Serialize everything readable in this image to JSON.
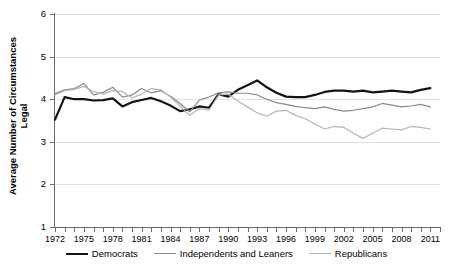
{
  "chart_data": {
    "type": "line",
    "title": "",
    "xlabel": "",
    "ylabel": "Average Number of Circumstances Legal",
    "ylabel_line1": "Average Number of Circumstances",
    "ylabel_line2": "Legal",
    "ylim": [
      1,
      6
    ],
    "xlim": [
      1972,
      2012
    ],
    "grid": true,
    "legend_position": "bottom",
    "ytick_labels": [
      "6",
      "5",
      "4",
      "3",
      "2",
      "1"
    ],
    "ytick_values": [
      6,
      5,
      4,
      3,
      2,
      1
    ],
    "xtick_labels": [
      "1972",
      "1975",
      "1978",
      "1981",
      "1984",
      "1987",
      "1990",
      "1993",
      "1996",
      "1999",
      "2002",
      "2005",
      "2008",
      "2011"
    ],
    "xtick_values": [
      1972,
      1975,
      1978,
      1981,
      1984,
      1987,
      1990,
      1993,
      1996,
      1999,
      2002,
      2005,
      2008,
      2011
    ],
    "x": [
      1972,
      1973,
      1974,
      1975,
      1976,
      1977,
      1978,
      1979,
      1980,
      1981,
      1982,
      1983,
      1984,
      1985,
      1986,
      1987,
      1988,
      1989,
      1990,
      1991,
      1992,
      1993,
      1994,
      1995,
      1996,
      1997,
      1998,
      1999,
      2000,
      2001,
      2002,
      2003,
      2004,
      2005,
      2006,
      2007,
      2008,
      2009,
      2010,
      2011
    ],
    "series": [
      {
        "name": "Democrats",
        "color": "#141414",
        "width": 2.2,
        "values": [
          3.52,
          4.05,
          4.0,
          4.0,
          3.97,
          3.98,
          4.02,
          3.83,
          3.93,
          3.98,
          4.03,
          3.95,
          3.85,
          3.72,
          3.76,
          3.83,
          3.8,
          4.12,
          4.06,
          4.22,
          4.33,
          4.44,
          4.28,
          4.15,
          4.06,
          4.05,
          4.05,
          4.1,
          4.17,
          4.2,
          4.2,
          4.18,
          4.2,
          4.16,
          4.18,
          4.2,
          4.18,
          4.16,
          4.22,
          4.26
        ]
      },
      {
        "name": "Independents and Leaners",
        "color": "#8a8a8a",
        "width": 1.2,
        "values": [
          4.13,
          4.22,
          4.25,
          4.37,
          4.1,
          4.16,
          4.28,
          4.05,
          4.1,
          4.25,
          4.15,
          4.2,
          4.07,
          3.9,
          3.7,
          3.98,
          4.05,
          4.15,
          4.17,
          4.14,
          4.14,
          4.1,
          4.0,
          3.92,
          3.88,
          3.83,
          3.8,
          3.78,
          3.82,
          3.76,
          3.72,
          3.74,
          3.78,
          3.82,
          3.9,
          3.86,
          3.82,
          3.84,
          3.88,
          3.82
        ]
      },
      {
        "name": "Republicans",
        "color": "#b5b5b5",
        "width": 1.2,
        "values": [
          4.1,
          4.2,
          4.23,
          4.3,
          4.18,
          4.12,
          4.2,
          4.18,
          4.03,
          4.12,
          4.25,
          4.22,
          4.05,
          3.84,
          3.62,
          3.78,
          3.74,
          4.1,
          4.12,
          3.96,
          3.82,
          3.68,
          3.6,
          3.72,
          3.74,
          3.62,
          3.54,
          3.42,
          3.3,
          3.36,
          3.34,
          3.2,
          3.08,
          3.2,
          3.32,
          3.3,
          3.28,
          3.36,
          3.34,
          3.3
        ]
      }
    ]
  },
  "legend": {
    "items": [
      {
        "label": "Democrats",
        "color": "#141414",
        "width": 2.4
      },
      {
        "label": "Independents and Leaners",
        "color": "#8a8a8a",
        "width": 1.4
      },
      {
        "label": "Republicans",
        "color": "#b5b5b5",
        "width": 1.4
      }
    ]
  }
}
